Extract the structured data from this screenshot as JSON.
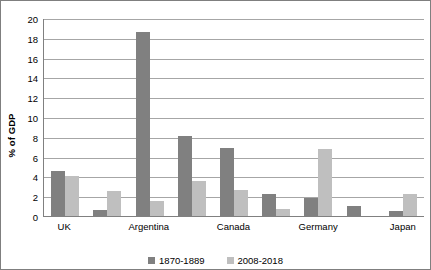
{
  "chart_data": {
    "type": "bar",
    "title": "",
    "xlabel": "",
    "ylabel": "% of GDP",
    "ylim": [
      0,
      20
    ],
    "ytick_step": 2,
    "yticks": [
      20,
      18,
      16,
      14,
      12,
      10,
      8,
      6,
      4,
      2,
      0
    ],
    "grid": true,
    "legend_position": "bottom-center",
    "categories": [
      "UK",
      "",
      "Argentina",
      "",
      "Canada",
      "",
      "Germany",
      "",
      "Japan"
    ],
    "visible_tick_labels": [
      "UK",
      "Argentina",
      "Canada",
      "Germany",
      "Japan"
    ],
    "series": [
      {
        "name": "1870-1889",
        "color": "#808080",
        "values": [
          4.5,
          0.6,
          18.6,
          8.1,
          6.9,
          2.2,
          1.8,
          1.0,
          0.5
        ]
      },
      {
        "name": "2008-2018",
        "color": "#bfbfbf",
        "values": [
          4.0,
          2.5,
          1.5,
          3.5,
          2.6,
          0.7,
          6.8,
          0.0,
          2.2
        ]
      }
    ]
  },
  "legend": {
    "items": [
      {
        "label": "1870-1889",
        "color": "#808080"
      },
      {
        "label": "2008-2018",
        "color": "#bfbfbf"
      }
    ]
  },
  "colors": {
    "series_1870_1889": "#808080",
    "series_2008_2018": "#bfbfbf",
    "gridline": "#a6a6a6",
    "axis": "#808080",
    "border": "#7f7f7f",
    "background": "#ffffff",
    "text": "#000000"
  }
}
